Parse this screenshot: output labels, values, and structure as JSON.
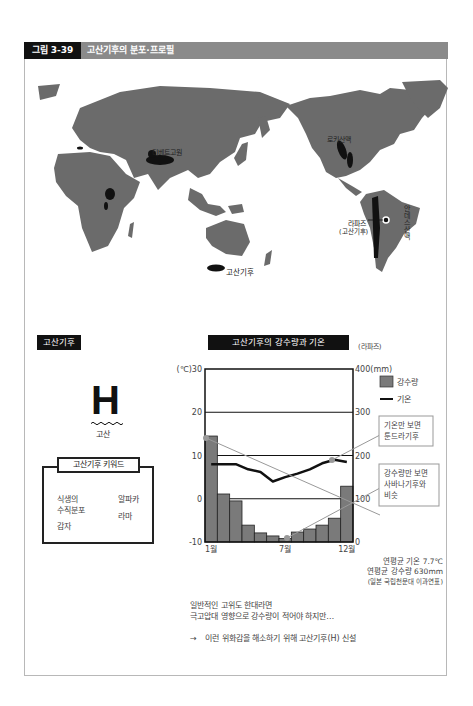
{
  "header": {
    "figure_number": "그림 3-39",
    "title": "고산기후의 분포·프로필"
  },
  "map": {
    "labels": {
      "tibet": "티베트고원",
      "rockies": "로키산맥",
      "andes": "안데스산맥",
      "lapaz": "라파즈",
      "lapaz_sub": "(고산기후)"
    },
    "legend_label": "고산기후",
    "colors": {
      "land": "#6b6b6b",
      "highland": "#111111",
      "ocean": "#ffffff"
    }
  },
  "left_panel": {
    "tag": "고산기후",
    "symbol": "H",
    "symbol_label": "고산",
    "keyword_title": "고산기후 키워드",
    "keywords_col1": [
      "식생의",
      "수직분포",
      "감자"
    ],
    "keywords_col2": [
      "알파카",
      "라마"
    ]
  },
  "chart_panel": {
    "tag": "고산기후의 강수량과 기온",
    "location": "(라파즈)",
    "annotation_temp": [
      "기온만 보면",
      "툰드라기후"
    ],
    "annotation_precip": [
      "강수량만 보면",
      "사바나기후와",
      "비슷"
    ],
    "stats": {
      "temp": "연평균 기온 7.7℃",
      "precip": "연평균 강수량 630mm",
      "source": "(일본 국립천문대 이과연표)"
    }
  },
  "chart_data": {
    "type": "bar+line",
    "title": "고산기후의 강수량과 기온",
    "subtitle": "(라파즈)",
    "categories": [
      "1월",
      "2월",
      "3월",
      "4월",
      "5월",
      "6월",
      "7월",
      "8월",
      "9월",
      "10월",
      "11월",
      "12월"
    ],
    "tick_labels_x": [
      "1월",
      "7월",
      "12월"
    ],
    "series": [
      {
        "name": "강수량",
        "type": "bar",
        "axis": "right",
        "unit": "mm",
        "color": "#7a7a7a",
        "values": [
          245,
          111,
          95,
          39,
          21,
          14,
          8,
          23,
          30,
          39,
          55,
          129
        ]
      },
      {
        "name": "기온",
        "type": "line",
        "axis": "left",
        "unit": "℃",
        "color": "#111111",
        "values": [
          8.0,
          8.0,
          8.0,
          6.8,
          6.2,
          4.0,
          5.0,
          5.8,
          6.8,
          8.2,
          9.0,
          8.5
        ]
      }
    ],
    "ylabel_left": "(℃)",
    "ylim_left": [
      -10,
      30
    ],
    "yticks_left": [
      -10,
      0,
      10,
      20,
      30
    ],
    "ylabel_right": "(mm)",
    "ylim_right": [
      0,
      400
    ],
    "yticks_right": [
      0,
      100,
      200,
      300,
      400
    ],
    "grid": true,
    "legend": [
      "강수량",
      "기온"
    ],
    "legend_position": "upper right outside"
  },
  "footer": {
    "line1": "일반적인 고위도 한대라면",
    "line2": "극고압대 영향으로 강수량이 적어야 하지만…",
    "arrow": "→",
    "conclusion": "이런 위화감을 해소하기 위해 고산기후(H) 신설"
  }
}
